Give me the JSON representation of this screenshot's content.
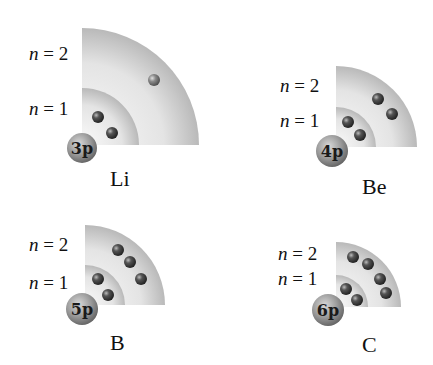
{
  "colors": {
    "shell_light": "#f4f4f4",
    "shell_dark": "#bdbdbd",
    "electron": "#3a3a3a",
    "nucleus": "#8c8c8c"
  },
  "atoms": [
    {
      "symbol": "Li",
      "nucleus_label": "3p",
      "shell_labels": {
        "n1": "n = 1",
        "n2": "n = 2"
      },
      "shells": [
        {
          "n": 1,
          "electrons": 2
        },
        {
          "n": 2,
          "electrons": 1
        }
      ]
    },
    {
      "symbol": "Be",
      "nucleus_label": "4p",
      "shell_labels": {
        "n1": "n = 1",
        "n2": "n = 2"
      },
      "shells": [
        {
          "n": 1,
          "electrons": 2
        },
        {
          "n": 2,
          "electrons": 2
        }
      ]
    },
    {
      "symbol": "B",
      "nucleus_label": "5p",
      "shell_labels": {
        "n1": "n = 1",
        "n2": "n = 2"
      },
      "shells": [
        {
          "n": 1,
          "electrons": 2
        },
        {
          "n": 2,
          "electrons": 3
        }
      ]
    },
    {
      "symbol": "C",
      "nucleus_label": "6p",
      "shell_labels": {
        "n1": "n = 1",
        "n2": "n = 2"
      },
      "shells": [
        {
          "n": 1,
          "electrons": 2
        },
        {
          "n": 2,
          "electrons": 4
        }
      ]
    }
  ]
}
